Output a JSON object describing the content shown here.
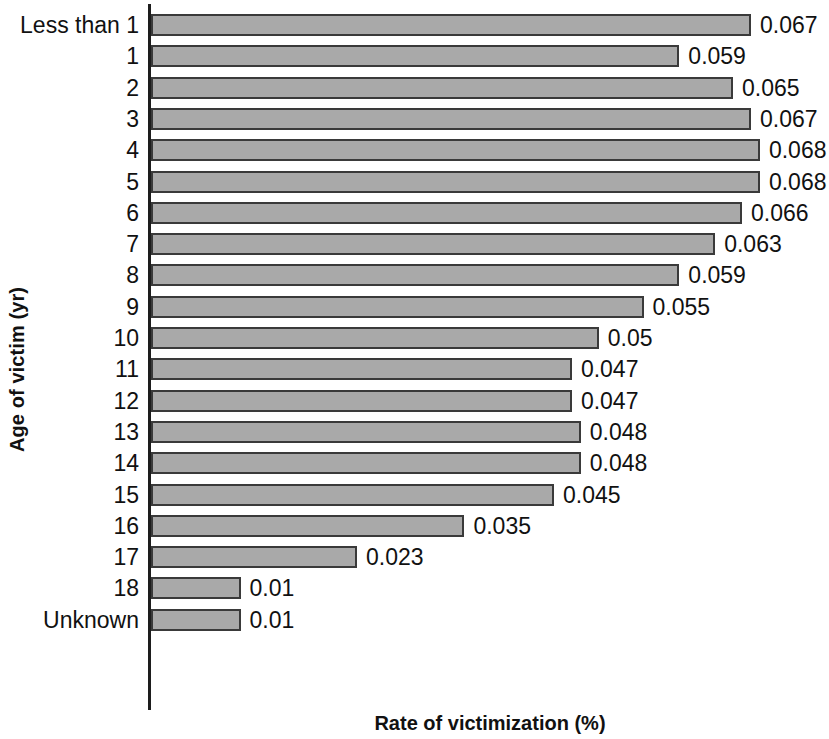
{
  "chart_data": {
    "type": "bar",
    "orientation": "horizontal",
    "title": "",
    "xlabel": "Rate of victimization (%)",
    "ylabel": "Age of victim (yr)",
    "grid": false,
    "legend": false,
    "xlim": [
      0,
      0.075
    ],
    "categories": [
      "Less than 1",
      "1",
      "2",
      "3",
      "4",
      "5",
      "6",
      "7",
      "8",
      "9",
      "10",
      "11",
      "12",
      "13",
      "14",
      "15",
      "16",
      "17",
      "18",
      "Unknown"
    ],
    "values": [
      0.067,
      0.059,
      0.065,
      0.067,
      0.068,
      0.068,
      0.066,
      0.063,
      0.059,
      0.055,
      0.05,
      0.047,
      0.047,
      0.048,
      0.048,
      0.045,
      0.035,
      0.023,
      0.01,
      0.01
    ],
    "value_labels": [
      "0.067",
      "0.059",
      "0.065",
      "0.067",
      "0.068",
      "0.068",
      "0.066",
      "0.063",
      "0.059",
      "0.055",
      "0.05",
      "0.047",
      "0.047",
      "0.048",
      "0.048",
      "0.045",
      "0.035",
      "0.023",
      "0.01",
      "0.01"
    ],
    "bar_color": "#a9a9a9",
    "bar_border_color": "#3a3a3a",
    "axis_color": "#1d1d1d"
  }
}
